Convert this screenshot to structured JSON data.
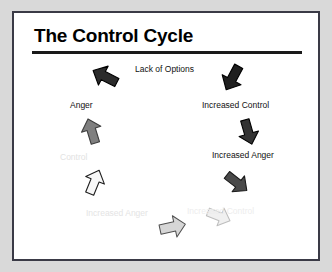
{
  "slide": {
    "title": "The Control Cycle",
    "background_color": "#ffffff",
    "frame_color": "#3a3a46",
    "page_background_color": "#d9d9d9",
    "rule_color": "#1a1a1a"
  },
  "cycle": {
    "direction": "clockwise",
    "stages": [
      {
        "label": "Lack of Options",
        "position": "top",
        "text_color": "#111111",
        "arrow": {
          "name": "arrow-lack-of-options",
          "fill": "#2b2b2b",
          "stroke": "#000000",
          "points_toward": "down-left",
          "rotation_deg": 205
        }
      },
      {
        "label": "Anger",
        "position": "upper-left",
        "text_color": "#111111",
        "arrow": {
          "name": "arrow-anger",
          "fill": "#7f7f7f",
          "stroke": "#3d3d3d",
          "points_toward": "down",
          "rotation_deg": 250
        }
      },
      {
        "label": "Control",
        "position": "left",
        "text_color": "#e2e2e2",
        "arrow": {
          "name": "arrow-control",
          "fill": "#f2f2f2",
          "stroke": "#1d1d1d",
          "points_toward": "down-right",
          "rotation_deg": 295
        }
      },
      {
        "label": "Increased Anger",
        "position": "bottom-left",
        "text_color": "#e4e4e4",
        "arrow": {
          "name": "arrow-increased-anger-faded",
          "fill": "#d6d6d6",
          "stroke": "#585858",
          "points_toward": "right",
          "rotation_deg": 340
        }
      },
      {
        "label": "Increased Control",
        "position": "bottom-right",
        "text_color": "#ededed",
        "arrow": {
          "name": "arrow-increased-control-faded",
          "fill": "#efefef",
          "stroke": "#9a9a9a",
          "points_toward": "up-right",
          "rotation_deg": 25
        }
      },
      {
        "label": "Increased Anger",
        "position": "right-lower",
        "text_color": "#111111",
        "arrow": {
          "name": "arrow-increased-anger",
          "fill": "#4a4a4a",
          "stroke": "#1a1a1a",
          "points_toward": "up-right",
          "rotation_deg": 35
        }
      },
      {
        "label": "Increased Control",
        "position": "right-upper",
        "text_color": "#111111",
        "arrow": {
          "name": "arrow-increased-control",
          "fill": "#333333",
          "stroke": "#000000",
          "points_toward": "up",
          "rotation_deg": 70
        }
      },
      {
        "label": "",
        "position": "top-right",
        "text_color": "#111111",
        "arrow": {
          "name": "arrow-top-right-return",
          "fill": "#1f1f1f",
          "stroke": "#000000",
          "points_toward": "up-left",
          "rotation_deg": 120
        }
      }
    ]
  }
}
